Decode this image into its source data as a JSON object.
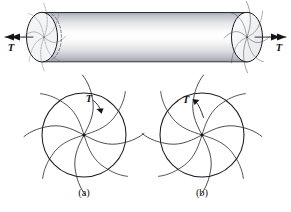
{
  "figure": {
    "background_color": "#ffffff",
    "ink_color": "#1b1b22",
    "width": 291,
    "height": 212
  },
  "shaft": {
    "name": "circular-shaft",
    "left_end": {
      "label": "T",
      "arrow_direction": "left",
      "arrow_heads": 2,
      "hidden_edges": true
    },
    "right_end": {
      "label": "T",
      "arrow_direction": "right",
      "arrow_heads": 2,
      "hidden_edges": false
    },
    "surface_fill_light": "#fdfdfd",
    "surface_fill_dark": "#b9bcc2"
  },
  "cross_sections": [
    {
      "key": "a",
      "caption": "(a)",
      "torque_label": "T",
      "rotation_sense": "clockwise",
      "arm_count": 8
    },
    {
      "key": "b",
      "caption": "(b)",
      "torque_label": "T",
      "rotation_sense": "counterclockwise",
      "arm_count": 8
    }
  ]
}
